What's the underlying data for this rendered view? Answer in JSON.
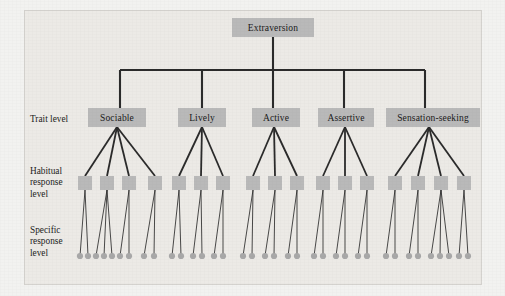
{
  "figure": {
    "background_color": "#eceae6",
    "box_color": "#b9b9b9",
    "line_color": "#2b2b2b",
    "dot_color": "#a8a8a8",
    "width": 505,
    "height": 296
  },
  "row_labels": [
    {
      "id": "trait-level",
      "text": "Trait level",
      "x": 30,
      "y": 114
    },
    {
      "id": "habitual-response-level",
      "text": "Habitual\nresponse\nlevel",
      "x": 30,
      "y": 166
    },
    {
      "id": "specific-response-level",
      "text": "Specific\nresponse\nlevel",
      "x": 30,
      "y": 225
    }
  ],
  "root": {
    "label": "Extraversion",
    "x": 232,
    "y": 18,
    "width": 82,
    "height": 19
  },
  "connector": {
    "trunk_x": 273,
    "trunk_top": 37,
    "bar_y": 70,
    "bar_left": 120,
    "bar_right": 425
  },
  "traits": [
    {
      "label": "Sociable",
      "x": 88,
      "y": 108,
      "width": 58,
      "height": 19,
      "drop_x": 120,
      "apex_x": 117,
      "apex_y": 127,
      "habitual": [
        {
          "x": 78,
          "y": 176,
          "width": 14,
          "height": 14,
          "specific": [
            {
              "x": 80
            },
            {
              "x": 88
            }
          ]
        },
        {
          "x": 100,
          "y": 176,
          "width": 14,
          "height": 14,
          "specific": [
            {
              "x": 96
            },
            {
              "x": 104
            },
            {
              "x": 112
            }
          ]
        },
        {
          "x": 122,
          "y": 176,
          "width": 14,
          "height": 14,
          "specific": [
            {
              "x": 120
            },
            {
              "x": 129
            }
          ]
        },
        {
          "x": 148,
          "y": 176,
          "width": 14,
          "height": 14,
          "specific": [
            {
              "x": 144
            },
            {
              "x": 154
            }
          ]
        }
      ]
    },
    {
      "label": "Lively",
      "x": 178,
      "y": 108,
      "width": 48,
      "height": 19,
      "drop_x": 202,
      "apex_x": 202,
      "apex_y": 127,
      "habitual": [
        {
          "x": 172,
          "y": 176,
          "width": 14,
          "height": 14,
          "specific": [
            {
              "x": 172
            },
            {
              "x": 181
            }
          ]
        },
        {
          "x": 194,
          "y": 176,
          "width": 14,
          "height": 14,
          "specific": [
            {
              "x": 193
            },
            {
              "x": 202
            }
          ]
        },
        {
          "x": 216,
          "y": 176,
          "width": 14,
          "height": 14,
          "specific": [
            {
              "x": 214
            },
            {
              "x": 223
            }
          ]
        }
      ]
    },
    {
      "label": "Active",
      "x": 252,
      "y": 108,
      "width": 48,
      "height": 19,
      "drop_x": 273,
      "apex_x": 274,
      "apex_y": 127,
      "habitual": [
        {
          "x": 246,
          "y": 176,
          "width": 14,
          "height": 14,
          "specific": [
            {
              "x": 243
            },
            {
              "x": 252
            }
          ]
        },
        {
          "x": 268,
          "y": 176,
          "width": 14,
          "height": 14,
          "specific": [
            {
              "x": 265
            },
            {
              "x": 274
            }
          ]
        },
        {
          "x": 290,
          "y": 176,
          "width": 14,
          "height": 14,
          "specific": [
            {
              "x": 288
            },
            {
              "x": 297
            }
          ]
        }
      ]
    },
    {
      "label": "Assertive",
      "x": 318,
      "y": 108,
      "width": 56,
      "height": 19,
      "drop_x": 344,
      "apex_x": 345,
      "apex_y": 127,
      "habitual": [
        {
          "x": 316,
          "y": 176,
          "width": 14,
          "height": 14,
          "specific": [
            {
              "x": 314
            },
            {
              "x": 323
            }
          ]
        },
        {
          "x": 338,
          "y": 176,
          "width": 14,
          "height": 14,
          "specific": [
            {
              "x": 336
            },
            {
              "x": 345
            }
          ]
        },
        {
          "x": 360,
          "y": 176,
          "width": 14,
          "height": 14,
          "specific": [
            {
              "x": 358
            },
            {
              "x": 367
            }
          ]
        }
      ]
    },
    {
      "label": "Sensation-seeking",
      "x": 386,
      "y": 108,
      "width": 94,
      "height": 19,
      "drop_x": 425,
      "apex_x": 429,
      "apex_y": 127,
      "habitual": [
        {
          "x": 388,
          "y": 176,
          "width": 14,
          "height": 14,
          "specific": [
            {
              "x": 386
            },
            {
              "x": 395
            }
          ]
        },
        {
          "x": 411,
          "y": 176,
          "width": 14,
          "height": 14,
          "specific": [
            {
              "x": 409
            },
            {
              "x": 418
            }
          ]
        },
        {
          "x": 434,
          "y": 176,
          "width": 14,
          "height": 14,
          "specific": [
            {
              "x": 431
            },
            {
              "x": 440
            },
            {
              "x": 449
            }
          ]
        },
        {
          "x": 457,
          "y": 176,
          "width": 14,
          "height": 14,
          "specific": [
            {
              "x": 459
            },
            {
              "x": 468
            }
          ]
        }
      ]
    }
  ],
  "specific_row_y": 256,
  "specific_dot_radius": 3.1
}
